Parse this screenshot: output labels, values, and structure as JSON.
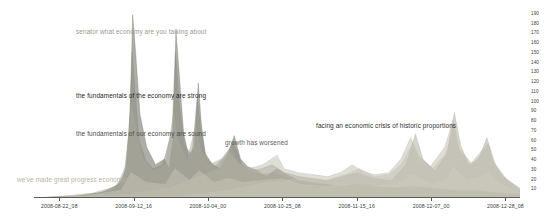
{
  "chart": {
    "type": "area",
    "title": "",
    "xlabel": "",
    "ylabel": ""
  },
  "chart_data": {
    "type": "area",
    "title": "",
    "subtitle": "",
    "xlabel": "",
    "ylabel": "",
    "grid": false,
    "legend_position": "none",
    "x_axis": {
      "type": "datetime",
      "tick_labels": [
        "2008-08-22_08",
        "2008-09-12_16",
        "2008-10-04_00",
        "2008-10-25_08",
        "2008-11-15_16",
        "2008-12-07_00",
        "2008-12-28_08"
      ],
      "tick_positions_frac": [
        0.052,
        0.205,
        0.358,
        0.511,
        0.664,
        0.817,
        0.97
      ],
      "range": [
        "2008-08-22_08",
        "2008-12-28_08"
      ]
    },
    "y_axis": {
      "tick_labels": [
        "190",
        "180",
        "170",
        "160",
        "150",
        "140",
        "130",
        "120",
        "110",
        "100",
        "90",
        "80",
        "70",
        "60",
        "50",
        "40",
        "30",
        "20",
        "10"
      ],
      "ylim": [
        0,
        195
      ],
      "side": "right"
    },
    "series": [
      {
        "name": "the fundamentals of the economy are strong",
        "color": "#6b6b63",
        "opacity": 0.55,
        "points": [
          [
            0.0,
            0
          ],
          [
            0.09,
            2
          ],
          [
            0.14,
            6
          ],
          [
            0.175,
            14
          ],
          [
            0.19,
            30
          ],
          [
            0.198,
            92
          ],
          [
            0.203,
            188
          ],
          [
            0.209,
            150
          ],
          [
            0.218,
            86
          ],
          [
            0.232,
            52
          ],
          [
            0.25,
            34
          ],
          [
            0.268,
            40
          ],
          [
            0.278,
            30
          ],
          [
            0.286,
            60
          ],
          [
            0.292,
            172
          ],
          [
            0.3,
            120
          ],
          [
            0.308,
            66
          ],
          [
            0.318,
            44
          ],
          [
            0.33,
            52
          ],
          [
            0.338,
            118
          ],
          [
            0.344,
            78
          ],
          [
            0.352,
            46
          ],
          [
            0.365,
            36
          ],
          [
            0.382,
            30
          ],
          [
            0.4,
            46
          ],
          [
            0.412,
            64
          ],
          [
            0.425,
            40
          ],
          [
            0.44,
            32
          ],
          [
            0.46,
            28
          ],
          [
            0.478,
            22
          ],
          [
            0.5,
            30
          ],
          [
            0.52,
            24
          ],
          [
            0.545,
            18
          ],
          [
            0.57,
            16
          ],
          [
            0.6,
            14
          ],
          [
            0.63,
            12
          ],
          [
            0.66,
            14
          ],
          [
            0.7,
            12
          ],
          [
            0.74,
            10
          ],
          [
            0.78,
            12
          ],
          [
            0.82,
            10
          ],
          [
            0.86,
            8
          ],
          [
            0.9,
            8
          ],
          [
            0.94,
            6
          ],
          [
            1.0,
            4
          ]
        ]
      },
      {
        "name": "senator what economy are you talking about",
        "color": "#8a8a7e",
        "opacity": 0.5,
        "points": [
          [
            0.0,
            0
          ],
          [
            0.1,
            2
          ],
          [
            0.16,
            8
          ],
          [
            0.185,
            22
          ],
          [
            0.196,
            70
          ],
          [
            0.202,
            150
          ],
          [
            0.208,
            110
          ],
          [
            0.216,
            60
          ],
          [
            0.23,
            38
          ],
          [
            0.245,
            30
          ],
          [
            0.265,
            34
          ],
          [
            0.284,
            70
          ],
          [
            0.291,
            150
          ],
          [
            0.299,
            96
          ],
          [
            0.31,
            54
          ],
          [
            0.325,
            44
          ],
          [
            0.336,
            104
          ],
          [
            0.343,
            70
          ],
          [
            0.355,
            40
          ],
          [
            0.372,
            32
          ],
          [
            0.395,
            44
          ],
          [
            0.41,
            58
          ],
          [
            0.428,
            34
          ],
          [
            0.45,
            26
          ],
          [
            0.47,
            24
          ],
          [
            0.495,
            26
          ],
          [
            0.52,
            20
          ],
          [
            0.55,
            16
          ],
          [
            0.58,
            14
          ],
          [
            0.62,
            12
          ],
          [
            0.66,
            12
          ],
          [
            0.7,
            10
          ],
          [
            0.75,
            10
          ],
          [
            0.8,
            9
          ],
          [
            0.85,
            7
          ],
          [
            0.9,
            6
          ],
          [
            0.95,
            5
          ],
          [
            1.0,
            3
          ]
        ]
      },
      {
        "name": "the fundamentals of our economy are sound",
        "color": "#a9a79a",
        "opacity": 0.5,
        "points": [
          [
            0.0,
            0
          ],
          [
            0.06,
            2
          ],
          [
            0.12,
            5
          ],
          [
            0.17,
            12
          ],
          [
            0.19,
            34
          ],
          [
            0.2,
            96
          ],
          [
            0.21,
            70
          ],
          [
            0.225,
            40
          ],
          [
            0.245,
            28
          ],
          [
            0.27,
            34
          ],
          [
            0.288,
            88
          ],
          [
            0.296,
            60
          ],
          [
            0.315,
            38
          ],
          [
            0.332,
            74
          ],
          [
            0.342,
            52
          ],
          [
            0.36,
            34
          ],
          [
            0.385,
            40
          ],
          [
            0.405,
            52
          ],
          [
            0.42,
            36
          ],
          [
            0.445,
            28
          ],
          [
            0.468,
            30
          ],
          [
            0.49,
            34
          ],
          [
            0.515,
            26
          ],
          [
            0.545,
            22
          ],
          [
            0.575,
            20
          ],
          [
            0.605,
            18
          ],
          [
            0.635,
            22
          ],
          [
            0.665,
            26
          ],
          [
            0.7,
            20
          ],
          [
            0.735,
            18
          ],
          [
            0.765,
            34
          ],
          [
            0.785,
            66
          ],
          [
            0.8,
            40
          ],
          [
            0.825,
            28
          ],
          [
            0.85,
            46
          ],
          [
            0.865,
            88
          ],
          [
            0.878,
            54
          ],
          [
            0.895,
            34
          ],
          [
            0.915,
            40
          ],
          [
            0.932,
            62
          ],
          [
            0.945,
            38
          ],
          [
            0.965,
            22
          ],
          [
            1.0,
            10
          ]
        ]
      },
      {
        "name": "growth has worsened",
        "color": "#b5b3a4",
        "opacity": 0.45,
        "points": [
          [
            0.0,
            0
          ],
          [
            0.2,
            4
          ],
          [
            0.28,
            10
          ],
          [
            0.34,
            22
          ],
          [
            0.38,
            30
          ],
          [
            0.4,
            48
          ],
          [
            0.415,
            38
          ],
          [
            0.44,
            30
          ],
          [
            0.47,
            34
          ],
          [
            0.5,
            44
          ],
          [
            0.515,
            30
          ],
          [
            0.545,
            26
          ],
          [
            0.575,
            24
          ],
          [
            0.605,
            22
          ],
          [
            0.63,
            26
          ],
          [
            0.655,
            34
          ],
          [
            0.675,
            28
          ],
          [
            0.7,
            24
          ],
          [
            0.73,
            26
          ],
          [
            0.755,
            40
          ],
          [
            0.775,
            62
          ],
          [
            0.79,
            44
          ],
          [
            0.815,
            32
          ],
          [
            0.845,
            52
          ],
          [
            0.862,
            80
          ],
          [
            0.875,
            50
          ],
          [
            0.9,
            36
          ],
          [
            0.92,
            48
          ],
          [
            0.935,
            56
          ],
          [
            0.95,
            34
          ],
          [
            0.975,
            18
          ],
          [
            1.0,
            8
          ]
        ]
      },
      {
        "name": "facing an economic crisis of historic proportions",
        "color": "#c4c2b4",
        "opacity": 0.45,
        "points": [
          [
            0.0,
            0
          ],
          [
            0.3,
            2
          ],
          [
            0.4,
            8
          ],
          [
            0.48,
            16
          ],
          [
            0.55,
            20
          ],
          [
            0.6,
            18
          ],
          [
            0.64,
            24
          ],
          [
            0.67,
            30
          ],
          [
            0.7,
            22
          ],
          [
            0.73,
            24
          ],
          [
            0.755,
            34
          ],
          [
            0.775,
            52
          ],
          [
            0.79,
            38
          ],
          [
            0.82,
            30
          ],
          [
            0.845,
            44
          ],
          [
            0.862,
            66
          ],
          [
            0.878,
            44
          ],
          [
            0.9,
            34
          ],
          [
            0.918,
            44
          ],
          [
            0.934,
            50
          ],
          [
            0.95,
            30
          ],
          [
            0.975,
            16
          ],
          [
            1.0,
            6
          ]
        ]
      },
      {
        "name": "we've made great progress economically",
        "color": "#cfcdbe",
        "opacity": 0.4,
        "points": [
          [
            0.0,
            0
          ],
          [
            0.1,
            2
          ],
          [
            0.18,
            8
          ],
          [
            0.2,
            26
          ],
          [
            0.23,
            16
          ],
          [
            0.27,
            14
          ],
          [
            0.29,
            30
          ],
          [
            0.32,
            18
          ],
          [
            0.34,
            28
          ],
          [
            0.37,
            16
          ],
          [
            0.4,
            20
          ],
          [
            0.43,
            16
          ],
          [
            0.47,
            18
          ],
          [
            0.51,
            20
          ],
          [
            0.55,
            14
          ],
          [
            0.6,
            12
          ],
          [
            0.65,
            14
          ],
          [
            0.7,
            12
          ],
          [
            0.75,
            16
          ],
          [
            0.78,
            24
          ],
          [
            0.82,
            14
          ],
          [
            0.85,
            20
          ],
          [
            0.863,
            32
          ],
          [
            0.89,
            18
          ],
          [
            0.92,
            22
          ],
          [
            0.935,
            26
          ],
          [
            0.96,
            14
          ],
          [
            1.0,
            6
          ]
        ]
      }
    ],
    "annotations": [
      {
        "id": "senator-what-economy",
        "text": "senator what economy are you talking about",
        "x_px": 76,
        "y_px": 28,
        "color": "#9a9a8e"
      },
      {
        "id": "fundamentals-strong",
        "text": "the fundamentals of the economy are strong",
        "x_px": 76,
        "y_px": 92,
        "color": "#1d1d1d"
      },
      {
        "id": "fundamentals-sound",
        "text": "the fundamentals of our economy are sound",
        "x_px": 76,
        "y_px": 130,
        "color": "#4a4a4a"
      },
      {
        "id": "growth-has-worsened",
        "text": "growth has worsened",
        "x_px": 225,
        "y_px": 139,
        "color": "#5c5c5c"
      },
      {
        "id": "economic-crisis",
        "text": "facing an economic crisis of historic proportions",
        "x_px": 316,
        "y_px": 122,
        "color": "#2e2e2e"
      },
      {
        "id": "made-great-progress",
        "text": "we've made great progress economically",
        "x_px": 17,
        "y_px": 176,
        "color": "#b9b2a6"
      }
    ]
  }
}
